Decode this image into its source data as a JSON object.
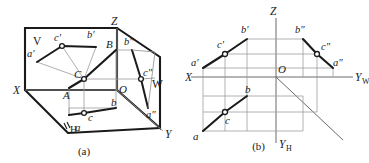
{
  "document": {
    "title": "Orthographic projection of triangle ABC",
    "background_color": "#ffffff",
    "line_color": "#1a1a1a",
    "thin_line_color": "#8a8a8a"
  },
  "figure_a": {
    "caption": "(a)",
    "description": "Three-plane axonometric projection box",
    "plane_labels": [
      {
        "name": "V",
        "text": "V"
      },
      {
        "name": "W",
        "text": "W"
      },
      {
        "name": "H",
        "text": "H"
      }
    ],
    "axis_labels": [
      {
        "name": "X",
        "text": "X"
      },
      {
        "name": "Y",
        "text": "Y"
      },
      {
        "name": "Z",
        "text": "Z"
      },
      {
        "name": "O",
        "text": "O"
      }
    ],
    "point_labels": [
      {
        "name": "A",
        "text": "A"
      },
      {
        "name": "B",
        "text": "B"
      },
      {
        "name": "C",
        "text": "C"
      },
      {
        "name": "a-prime",
        "text": "a′"
      },
      {
        "name": "b-prime",
        "text": "b′"
      },
      {
        "name": "c-prime",
        "text": "c′"
      },
      {
        "name": "a-dprime",
        "text": "a″"
      },
      {
        "name": "b-dprime",
        "text": "b″"
      },
      {
        "name": "c-dprime",
        "text": "c″"
      },
      {
        "name": "a",
        "text": "a"
      },
      {
        "name": "b",
        "text": "b"
      },
      {
        "name": "c",
        "text": "c"
      }
    ]
  },
  "figure_b": {
    "caption": "(b)",
    "description": "Unfolded three-view orthographic projection",
    "axis_labels": [
      {
        "name": "X",
        "text": "X"
      },
      {
        "name": "Z",
        "text": "Z"
      },
      {
        "name": "O",
        "text": "O"
      },
      {
        "name": "YW",
        "text": "Y",
        "sub": "W"
      },
      {
        "name": "YH",
        "text": "Y",
        "sub": "H"
      }
    ],
    "point_labels": [
      {
        "name": "a-prime",
        "text": "a′"
      },
      {
        "name": "b-prime",
        "text": "b′"
      },
      {
        "name": "c-prime",
        "text": "c′"
      },
      {
        "name": "a-dprime",
        "text": "a″"
      },
      {
        "name": "b-dprime",
        "text": "b″"
      },
      {
        "name": "c-dprime",
        "text": "c″"
      },
      {
        "name": "a",
        "text": "a"
      },
      {
        "name": "b",
        "text": "b"
      },
      {
        "name": "c",
        "text": "c"
      }
    ]
  }
}
